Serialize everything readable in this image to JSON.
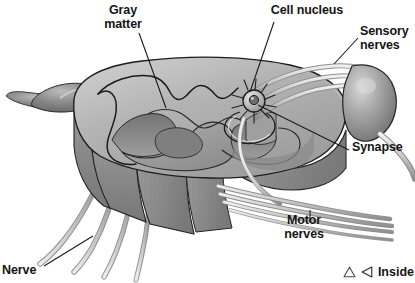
{
  "figure": {
    "background_color": "#ffffff",
    "text_color": "#151515"
  },
  "labels": [
    {
      "id": "gray-matter",
      "text": "Gray\nmatter",
      "align": "center"
    },
    {
      "id": "cell-nucleus",
      "text": "Cell nucleus",
      "align": "center"
    },
    {
      "id": "sensory",
      "text": "Sensory\nnerves",
      "align": "left"
    },
    {
      "id": "synapse",
      "text": "Synapse",
      "align": "left"
    },
    {
      "id": "motor",
      "text": "Motor\nnerves",
      "align": "center"
    },
    {
      "id": "nerve",
      "text": "Nerve",
      "align": "left"
    }
  ],
  "legend": {
    "triangle_icon": "triangle-up-outline-icon",
    "arrow_icon": "triangle-left-outline-icon",
    "text": "Inside"
  },
  "illustration": {
    "type": "grayscale-anatomical-drawing",
    "subject": "spinal cord segment, cut transversely, showing butterfly-shaped gray matter, dorsal root ganglion, sensory and motor nerve roots, a neuron cell body and a synapse",
    "palette": {
      "outline": "#1b1b1b",
      "white_matter_top": "#b9b9b9",
      "white_matter_highlight": "#d6d6d6",
      "gray_matter_fill": "#9a9a9a",
      "cut_face_dark": "#7c7c7c",
      "cut_face_mid": "#8f8f8f",
      "cut_face_light": "#a8a8a8",
      "ganglion_dark": "#6e6e6e",
      "ganglion_light": "#c4c4c4",
      "nerve_fiber": "#cfcfcf",
      "nerve_fiber_shadow": "#8b8b8b",
      "leader_line": "#1b1b1b"
    }
  }
}
